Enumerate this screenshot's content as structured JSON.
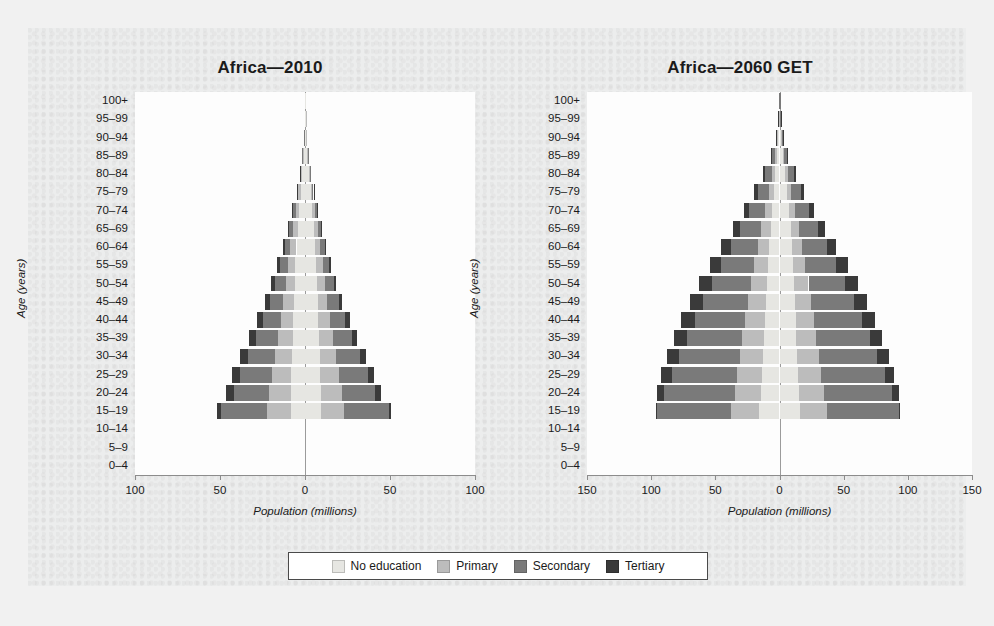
{
  "figure": {
    "background": "#eceded",
    "panel_background": "#ffffff"
  },
  "legend": {
    "items": [
      {
        "label": "No education",
        "color": "#e6e6e2"
      },
      {
        "label": "Primary",
        "color": "#bcbcbc"
      },
      {
        "label": "Secondary",
        "color": "#7a7a7a"
      },
      {
        "label": "Tertiary",
        "color": "#3a3a3a"
      }
    ]
  },
  "chart_data": [
    {
      "type": "bar",
      "subtype": "population-pyramid-stacked",
      "title": "Africa—2010",
      "annotation": "1.02 billion",
      "left_label": "Men",
      "right_label": "Women",
      "xlabel": "Population (millions)",
      "ylabel": "Age (years)",
      "xlim": [
        -100,
        100
      ],
      "xticks": [
        -100,
        -50,
        0,
        50,
        100
      ],
      "xticklabels": [
        "100",
        "50",
        "0",
        "50",
        "100"
      ],
      "grid": false,
      "legend_position": "bottom",
      "categories": [
        "100+",
        "95–99",
        "90–94",
        "85–89",
        "80–84",
        "75–79",
        "70–74",
        "65–69",
        "60–64",
        "55–59",
        "50–54",
        "45–49",
        "40–44",
        "35–39",
        "30–34",
        "25–29",
        "20–24",
        "15–19",
        "10–14",
        "5–9",
        "0–4"
      ],
      "series": [
        {
          "name": "No education",
          "side": "men",
          "color": "#e6e6e2",
          "values": [
            0.05,
            0.2,
            0.5,
            1.0,
            1.8,
            2.6,
            3.5,
            4.3,
            5.0,
            5.6,
            6.0,
            6.4,
            6.8,
            7.2,
            7.6,
            8.0,
            8.2,
            8.5,
            0,
            0,
            0
          ]
        },
        {
          "name": "Primary",
          "side": "men",
          "color": "#bcbcbc",
          "values": [
            0.01,
            0.05,
            0.15,
            0.4,
            0.8,
            1.3,
            2.0,
            2.8,
            3.6,
            4.5,
            5.4,
            6.4,
            7.5,
            8.8,
            10.2,
            11.6,
            12.8,
            14.0,
            0,
            0,
            0
          ]
        },
        {
          "name": "Secondary",
          "side": "men",
          "color": "#7a7a7a",
          "values": [
            0.0,
            0.02,
            0.06,
            0.2,
            0.5,
            0.9,
            1.5,
            2.3,
            3.3,
            4.6,
            6.2,
            8.0,
            10.2,
            12.8,
            15.6,
            18.4,
            21.0,
            27.0,
            0,
            0,
            0
          ]
        },
        {
          "name": "Tertiary",
          "side": "men",
          "color": "#3a3a3a",
          "values": [
            0.0,
            0.0,
            0.01,
            0.03,
            0.1,
            0.2,
            0.4,
            0.7,
            1.1,
            1.6,
            2.2,
            2.9,
            3.6,
            4.3,
            4.9,
            5.2,
            4.6,
            2.0,
            0,
            0,
            0
          ]
        },
        {
          "name": "No education",
          "side": "women",
          "color": "#e6e6e2",
          "values": [
            0.07,
            0.3,
            0.7,
            1.4,
            2.4,
            3.4,
            4.4,
            5.3,
            6.0,
            6.6,
            7.0,
            7.4,
            7.8,
            8.2,
            8.6,
            9.0,
            9.2,
            9.4,
            0,
            0,
            0
          ]
        },
        {
          "name": "Primary",
          "side": "women",
          "color": "#bcbcbc",
          "values": [
            0.01,
            0.05,
            0.12,
            0.3,
            0.6,
            1.0,
            1.6,
            2.3,
            3.1,
            3.9,
            4.8,
            5.8,
            7.0,
            8.3,
            9.7,
            11.2,
            12.5,
            13.8,
            0,
            0,
            0
          ]
        },
        {
          "name": "Secondary",
          "side": "women",
          "color": "#7a7a7a",
          "values": [
            0.0,
            0.01,
            0.04,
            0.12,
            0.3,
            0.6,
            1.0,
            1.7,
            2.6,
            3.7,
            5.1,
            6.8,
            8.9,
            11.3,
            14.0,
            16.8,
            19.6,
            26.0,
            0,
            0,
            0
          ]
        },
        {
          "name": "Tertiary",
          "side": "women",
          "color": "#3a3a3a",
          "values": [
            0.0,
            0.0,
            0.0,
            0.01,
            0.04,
            0.1,
            0.2,
            0.4,
            0.7,
            1.0,
            1.5,
            2.0,
            2.5,
            3.0,
            3.5,
            3.8,
            3.4,
            1.6,
            0,
            0,
            0
          ]
        }
      ]
    },
    {
      "type": "bar",
      "subtype": "population-pyramid-stacked",
      "title": "Africa—2060 GET",
      "annotation": "2.22 billions",
      "left_label": "Men",
      "right_label": "Women",
      "xlabel": "Population (millions)",
      "ylabel": "Age (years)",
      "xlim": [
        -150,
        150
      ],
      "xticks": [
        -150,
        -100,
        -50,
        0,
        50,
        100,
        150
      ],
      "xticklabels": [
        "150",
        "100",
        "50",
        "0",
        "50",
        "100",
        "150"
      ],
      "grid": false,
      "legend_position": "bottom",
      "categories": [
        "100+",
        "95–99",
        "90–94",
        "85–89",
        "80–84",
        "75–79",
        "70–74",
        "65–69",
        "60–64",
        "55–59",
        "50–54",
        "45–49",
        "40–44",
        "35–39",
        "30–34",
        "25–29",
        "20–24",
        "15–19",
        "10–14",
        "5–9",
        "0–4"
      ],
      "series": [
        {
          "name": "No education",
          "side": "men",
          "color": "#e6e6e2",
          "values": [
            0.1,
            0.4,
            1.0,
            2.0,
            3.2,
            4.4,
            5.6,
            6.8,
            7.8,
            8.8,
            9.6,
            10.4,
            11.2,
            12.0,
            12.8,
            13.6,
            14.4,
            15.6,
            0,
            0,
            0
          ]
        },
        {
          "name": "Primary",
          "side": "men",
          "color": "#bcbcbc",
          "values": [
            0.05,
            0.2,
            0.6,
            1.4,
            2.6,
            4.0,
            5.6,
            7.4,
            9.2,
            11.0,
            12.6,
            14.2,
            15.6,
            17.0,
            18.2,
            19.4,
            20.6,
            22.0,
            0,
            0,
            0
          ]
        },
        {
          "name": "Secondary",
          "side": "men",
          "color": "#7a7a7a",
          "values": [
            0.1,
            0.4,
            1.2,
            2.8,
            5.2,
            8.4,
            12.2,
            16.4,
            21.0,
            25.8,
            30.4,
            34.8,
            39.0,
            43.0,
            47.0,
            51.0,
            55.0,
            57.5,
            0,
            0,
            0
          ]
        },
        {
          "name": "Tertiary",
          "side": "men",
          "color": "#3a3a3a",
          "values": [
            0.02,
            0.1,
            0.3,
            0.8,
            1.6,
            2.8,
            4.2,
            5.8,
            7.4,
            8.8,
            9.8,
            10.4,
            10.6,
            10.4,
            9.6,
            8.2,
            5.8,
            1.0,
            0,
            0,
            0
          ]
        },
        {
          "name": "No education",
          "side": "women",
          "color": "#e6e6e2",
          "values": [
            0.15,
            0.5,
            1.3,
            2.6,
            4.2,
            5.8,
            7.2,
            8.6,
            9.6,
            10.6,
            11.4,
            12.0,
            12.6,
            13.2,
            13.8,
            14.4,
            15.0,
            16.0,
            0,
            0,
            0
          ]
        },
        {
          "name": "Primary",
          "side": "women",
          "color": "#bcbcbc",
          "values": [
            0.05,
            0.2,
            0.5,
            1.2,
            2.2,
            3.4,
            4.8,
            6.4,
            8.0,
            9.6,
            11.2,
            12.8,
            14.2,
            15.6,
            17.0,
            18.2,
            19.4,
            21.0,
            0,
            0,
            0
          ]
        },
        {
          "name": "Secondary",
          "side": "women",
          "color": "#7a7a7a",
          "values": [
            0.08,
            0.3,
            1.0,
            2.4,
            4.6,
            7.6,
            11.2,
            15.2,
            19.6,
            24.2,
            28.8,
            33.2,
            37.4,
            41.4,
            45.4,
            49.4,
            53.6,
            56.0,
            0,
            0,
            0
          ]
        },
        {
          "name": "Tertiary",
          "side": "women",
          "color": "#3a3a3a",
          "values": [
            0.02,
            0.08,
            0.25,
            0.7,
            1.5,
            2.6,
            4.0,
            5.6,
            7.2,
            8.6,
            9.6,
            10.2,
            10.4,
            10.0,
            9.2,
            7.6,
            5.2,
            0.9,
            0,
            0,
            0
          ]
        }
      ]
    }
  ]
}
